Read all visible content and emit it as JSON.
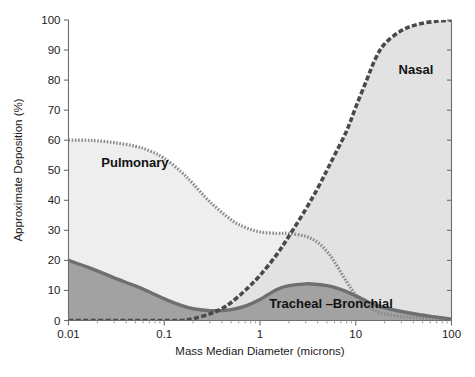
{
  "chart_data": {
    "type": "line",
    "title": "",
    "xlabel": "Mass Median Diameter (microns)",
    "ylabel": "Approximate Deposition (%)",
    "x_scale": "log",
    "xlim": [
      0.01,
      100
    ],
    "ylim": [
      0,
      100
    ],
    "grid": false,
    "legend_position": "inline-annotations",
    "xticks": [
      "0.01",
      "0.1",
      "1",
      "10",
      "100"
    ],
    "yticks": [
      "0",
      "10",
      "20",
      "30",
      "40",
      "50",
      "60",
      "70",
      "80",
      "90",
      "100"
    ],
    "colors": {
      "nasal_line": "#4a4a4a",
      "pulmonary_line": "#8a8a8a",
      "tracheal_line": "#6f6f6f",
      "nasal_fill": "#e2e2e2",
      "pulmonary_fill": "#eeeeee",
      "tracheal_fill": "#a2a2a2",
      "axis": "#6e6e6e",
      "text": "#1a1a1a"
    },
    "series": [
      {
        "name": "Nasal",
        "label": "Nasal",
        "label_x": 28,
        "label_y": 82,
        "style": "dashed-thick",
        "points": [
          [
            0.01,
            0.0
          ],
          [
            0.05,
            0.0
          ],
          [
            0.1,
            0.0
          ],
          [
            0.15,
            0.0
          ],
          [
            0.2,
            0.6
          ],
          [
            0.3,
            2.2
          ],
          [
            0.4,
            4.0
          ],
          [
            0.5,
            6.0
          ],
          [
            0.7,
            10.0
          ],
          [
            1.0,
            15.0
          ],
          [
            1.5,
            22.0
          ],
          [
            2.0,
            28.0
          ],
          [
            3.0,
            37.0
          ],
          [
            4.0,
            44.0
          ],
          [
            5.0,
            50.0
          ],
          [
            6.0,
            55.0
          ],
          [
            8.0,
            63.0
          ],
          [
            10.0,
            71.0
          ],
          [
            13.0,
            80.0
          ],
          [
            16.0,
            87.0
          ],
          [
            20.0,
            92.0
          ],
          [
            30.0,
            96.5
          ],
          [
            45.0,
            98.6
          ],
          [
            70.0,
            99.6
          ],
          [
            100.0,
            100.0
          ]
        ]
      },
      {
        "name": "Pulmonary",
        "label": "Pulmonary",
        "label_x": 0.022,
        "label_y": 51,
        "style": "dotted-medium",
        "points": [
          [
            0.01,
            60.0
          ],
          [
            0.015,
            60.0
          ],
          [
            0.02,
            59.8
          ],
          [
            0.03,
            59.2
          ],
          [
            0.05,
            58.0
          ],
          [
            0.07,
            56.5
          ],
          [
            0.1,
            54.0
          ],
          [
            0.15,
            49.5
          ],
          [
            0.2,
            45.5
          ],
          [
            0.3,
            39.5
          ],
          [
            0.5,
            33.5
          ],
          [
            0.7,
            31.0
          ],
          [
            1.0,
            29.5
          ],
          [
            1.5,
            29.0
          ],
          [
            2.0,
            29.0
          ],
          [
            3.0,
            28.0
          ],
          [
            4.0,
            26.0
          ],
          [
            5.0,
            23.0
          ],
          [
            6.0,
            19.5
          ],
          [
            8.0,
            13.0
          ],
          [
            10.0,
            8.5
          ],
          [
            13.0,
            5.0
          ],
          [
            16.0,
            3.2
          ],
          [
            20.0,
            2.2
          ],
          [
            30.0,
            1.3
          ],
          [
            50.0,
            0.8
          ],
          [
            70.0,
            0.5
          ],
          [
            100.0,
            0.3
          ]
        ]
      },
      {
        "name": "Tracheal-Bronchial",
        "label": "Tracheal –Bronchial",
        "label_x": 1.25,
        "label_y": 4.0,
        "style": "solid-thick",
        "points": [
          [
            0.01,
            20.0
          ],
          [
            0.015,
            18.0
          ],
          [
            0.02,
            16.5
          ],
          [
            0.03,
            14.2
          ],
          [
            0.05,
            11.5
          ],
          [
            0.07,
            9.5
          ],
          [
            0.1,
            7.2
          ],
          [
            0.15,
            5.0
          ],
          [
            0.2,
            3.9
          ],
          [
            0.3,
            3.3
          ],
          [
            0.4,
            3.3
          ],
          [
            0.5,
            3.6
          ],
          [
            0.7,
            4.8
          ],
          [
            1.0,
            7.0
          ],
          [
            1.5,
            10.3
          ],
          [
            2.0,
            11.6
          ],
          [
            3.0,
            12.2
          ],
          [
            4.0,
            12.0
          ],
          [
            5.0,
            11.6
          ],
          [
            6.0,
            11.0
          ],
          [
            8.0,
            9.6
          ],
          [
            10.0,
            8.2
          ],
          [
            13.0,
            6.4
          ],
          [
            16.0,
            5.1
          ],
          [
            20.0,
            4.2
          ],
          [
            30.0,
            3.0
          ],
          [
            45.0,
            2.0
          ],
          [
            70.0,
            1.1
          ],
          [
            100.0,
            0.4
          ]
        ]
      }
    ]
  }
}
